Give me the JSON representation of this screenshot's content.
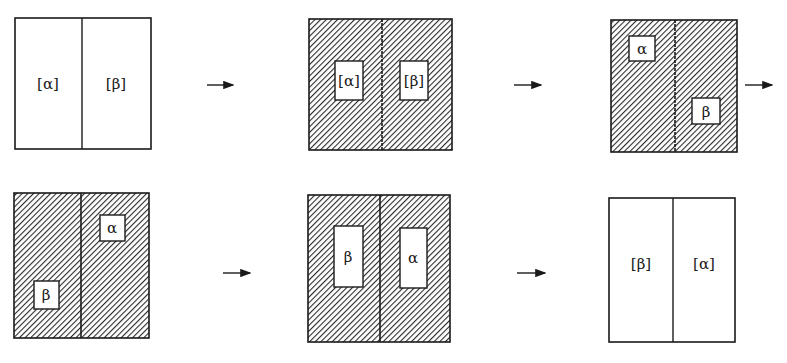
{
  "diagram": {
    "type": "process-sequence",
    "colors": {
      "line": "#1a1a1a",
      "hatch": "#2a2a2a",
      "background": "#ffffff"
    },
    "panels": [
      {
        "id": 1,
        "shaded": false,
        "labels": [
          {
            "text": "[α]"
          },
          {
            "text": "[β]"
          }
        ]
      },
      {
        "id": 2,
        "shaded": true,
        "labels": [
          {
            "text": "[α]"
          },
          {
            "text": "[β]"
          }
        ]
      },
      {
        "id": 3,
        "shaded": true,
        "labels": [
          {
            "text": "α"
          },
          {
            "text": "β"
          }
        ]
      },
      {
        "id": 4,
        "shaded": true,
        "labels": [
          {
            "text": "α"
          },
          {
            "text": "β"
          }
        ]
      },
      {
        "id": 5,
        "shaded": true,
        "labels": [
          {
            "text": "β"
          },
          {
            "text": "α"
          }
        ]
      },
      {
        "id": 6,
        "shaded": false,
        "labels": [
          {
            "text": "[β]"
          },
          {
            "text": "[α]"
          }
        ]
      }
    ],
    "arrows": [
      {
        "from": 1,
        "to": 2,
        "symbol": "→"
      },
      {
        "from": 2,
        "to": 3,
        "symbol": "→"
      },
      {
        "from": 3,
        "to": 4,
        "symbol": "→"
      },
      {
        "from": 4,
        "to": 5,
        "symbol": "→"
      },
      {
        "from": 5,
        "to": 6,
        "symbol": "→"
      }
    ]
  }
}
